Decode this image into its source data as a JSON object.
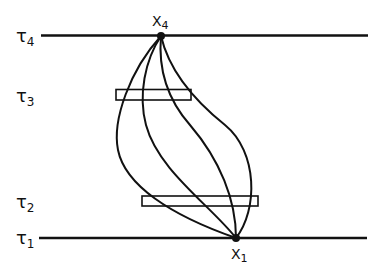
{
  "diagram": {
    "levels": [
      {
        "id": "tau4",
        "label": "τ",
        "subscript": "4",
        "y": 35
      },
      {
        "id": "tau3",
        "label": "τ",
        "subscript": "3",
        "y": 95
      },
      {
        "id": "tau2",
        "label": "τ",
        "subscript": "2",
        "y": 201
      },
      {
        "id": "tau1",
        "label": "τ",
        "subscript": "1",
        "y": 238
      }
    ],
    "points": [
      {
        "id": "x4",
        "label": "X",
        "subscript": "4"
      },
      {
        "id": "x1",
        "label": "X",
        "subscript": "1"
      }
    ],
    "windows": [
      {
        "id": "window-tau3",
        "level": "tau3"
      },
      {
        "id": "window-tau2",
        "level": "tau2"
      }
    ],
    "paths_count": 4,
    "colors": {
      "ink": "#111111",
      "background": "#ffffff"
    }
  }
}
